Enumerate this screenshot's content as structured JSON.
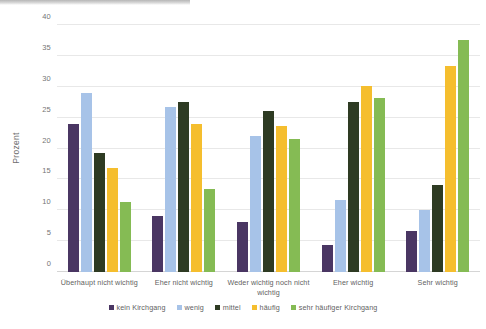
{
  "chart_data": {
    "type": "bar",
    "title": "",
    "subtitle": "",
    "xlabel": "",
    "ylabel": "Prozent",
    "ylim": [
      0,
      40
    ],
    "yticks": [
      0,
      5,
      10,
      15,
      20,
      25,
      30,
      35,
      40
    ],
    "ytick_labels": [
      "0",
      "5",
      "10",
      "15",
      "20",
      "25",
      "30",
      "35",
      "40"
    ],
    "grid": true,
    "legend_position": "bottom",
    "categories": [
      "Überhaupt nicht wichtig",
      "Eher nicht wichtig",
      "Weder wichtig noch nicht wichtig",
      "Eher wichtig",
      "Sehr wichtig"
    ],
    "series": [
      {
        "name": "kein Kirchgang",
        "color": "#4A3663",
        "values": [
          24.0,
          9.1,
          8.1,
          4.4,
          6.7
        ]
      },
      {
        "name": "wenig",
        "color": "#A7C3E8",
        "values": [
          29.0,
          26.8,
          22.1,
          11.6,
          10.1
        ]
      },
      {
        "name": "mittel",
        "color": "#2E3B23",
        "values": [
          19.3,
          27.6,
          26.0,
          27.6,
          14.1
        ]
      },
      {
        "name": "häufig",
        "color": "#F5BE2E",
        "values": [
          16.8,
          23.9,
          23.7,
          30.2,
          33.3
        ]
      },
      {
        "name": "sehr häufiger Kirchgang",
        "color": "#85BB54",
        "values": [
          11.4,
          13.5,
          21.6,
          28.2,
          37.5
        ]
      }
    ]
  }
}
